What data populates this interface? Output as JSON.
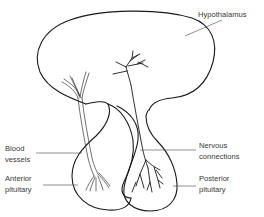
{
  "diagram": {
    "type": "anatomical line drawing",
    "labels": {
      "hypothalamus": "Hypothalamus",
      "blood_vessels": [
        "Blood",
        "vessels"
      ],
      "nervous_connections": [
        "Nervous",
        "connections"
      ],
      "anterior_pituitary": [
        "Anterior",
        "pituitary"
      ],
      "posterior_pituitary": [
        "Posterior",
        "pituitary"
      ]
    },
    "colors": {
      "line": "#1a1a1a",
      "text": "#3a3a3a",
      "background": "#ffffff"
    }
  }
}
